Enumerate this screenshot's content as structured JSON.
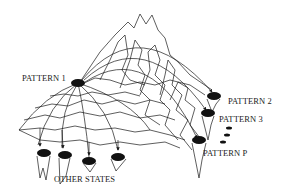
{
  "diagram": {
    "type": "energy-landscape",
    "colors": {
      "line": "#1a1a1a",
      "well": "#111111",
      "background": "#ffffff"
    },
    "labels": {
      "pattern_1": "PATTERN 1",
      "pattern_2": "PATTERN 2",
      "pattern_3": "PATTERN 3",
      "pattern_p": "PATTERN P",
      "other_states": "OTHER STATES"
    },
    "wells": [
      {
        "id": "pattern-1",
        "label": "PATTERN 1"
      },
      {
        "id": "pattern-2",
        "label": "PATTERN 2"
      },
      {
        "id": "pattern-3",
        "label": "PATTERN 3"
      },
      {
        "id": "pattern-p",
        "label": "PATTERN P"
      },
      {
        "id": "other-state-1",
        "label": "OTHER STATES"
      },
      {
        "id": "other-state-2",
        "label": "OTHER STATES"
      },
      {
        "id": "other-state-3",
        "label": "OTHER STATES"
      },
      {
        "id": "other-state-4",
        "label": "OTHER STATES"
      }
    ],
    "ellipsis_dots": 3
  }
}
